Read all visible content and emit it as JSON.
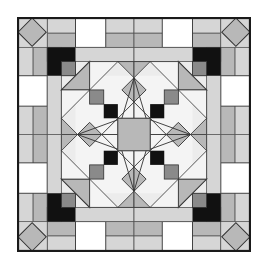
{
  "figure": {
    "colors": {
      "border": "#1a1a1a",
      "black": "#111111",
      "dark_gray": "#8a8a8a",
      "mid_gray": "#b8b8b8",
      "light_gray": "#d6d6d6",
      "pale": "#ececec",
      "white": "#ffffff",
      "line": "#333333"
    }
  }
}
